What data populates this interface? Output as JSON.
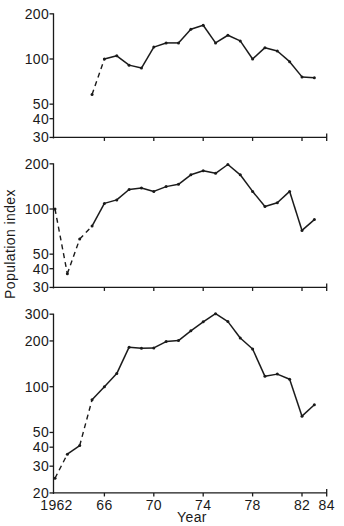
{
  "figure": {
    "ylabel": "Population index",
    "xlabel": "Year",
    "colors": {
      "line": "#1a1a1a",
      "background": "#ffffff"
    }
  },
  "chart_data": {
    "type": "line",
    "title": "",
    "xlabel": "Year",
    "ylabel": "Population index",
    "x_ticks": [
      1962,
      1966,
      1970,
      1974,
      1978,
      1982,
      1984
    ],
    "x_tick_labels": [
      "1962",
      "66",
      "70",
      "74",
      "78",
      "82",
      "84"
    ],
    "xlim": [
      1962,
      1984
    ],
    "yscale": "log",
    "grid": false,
    "legend": "none",
    "panels": [
      {
        "name": "top",
        "ylim": [
          30,
          200
        ],
        "y_ticks": [
          30,
          40,
          50,
          100,
          200
        ],
        "y_tick_labels": [
          "30",
          "40",
          "50",
          "100",
          "200"
        ],
        "x": [
          1965,
          1966,
          1967,
          1968,
          1969,
          1970,
          1971,
          1972,
          1973,
          1974,
          1975,
          1976,
          1977,
          1978,
          1979,
          1980,
          1981,
          1982,
          1983
        ],
        "values": [
          58,
          100,
          105,
          91,
          87,
          120,
          128,
          128,
          158,
          168,
          128,
          144,
          132,
          100,
          119,
          113,
          96,
          76,
          75
        ],
        "dashed_segments_from": [
          1965
        ]
      },
      {
        "name": "middle",
        "ylim": [
          30,
          200
        ],
        "y_ticks": [
          30,
          40,
          50,
          100,
          200
        ],
        "y_tick_labels": [
          "30",
          "40",
          "50",
          "100",
          "200"
        ],
        "x": [
          1962,
          1963,
          1964,
          1965,
          1966,
          1967,
          1968,
          1969,
          1970,
          1971,
          1972,
          1973,
          1974,
          1975,
          1976,
          1977,
          1978,
          1979,
          1980,
          1981,
          1982,
          1983
        ],
        "values": [
          100,
          37,
          63,
          77,
          109,
          115,
          135,
          138,
          131,
          141,
          146,
          169,
          180,
          173,
          198,
          169,
          131,
          104,
          110,
          131,
          72,
          85
        ],
        "dashed_segments_from": [
          1962,
          1963,
          1964
        ]
      },
      {
        "name": "bottom",
        "ylim": [
          20,
          300
        ],
        "y_ticks": [
          20,
          30,
          40,
          50,
          100,
          200,
          300
        ],
        "y_tick_labels": [
          "20",
          "30",
          "40",
          "50",
          "100",
          "200",
          "300"
        ],
        "x": [
          1962,
          1963,
          1964,
          1965,
          1966,
          1967,
          1968,
          1969,
          1970,
          1971,
          1972,
          1973,
          1974,
          1975,
          1976,
          1977,
          1978,
          1979,
          1980,
          1981,
          1982,
          1983
        ],
        "values": [
          25,
          36,
          41,
          82,
          100,
          122,
          182,
          179,
          180,
          198,
          201,
          233,
          267,
          302,
          268,
          209,
          177,
          117,
          121,
          112,
          64,
          76
        ],
        "dashed_segments_from": [
          1962,
          1964
        ],
        "show_x_tick_labels": true
      }
    ]
  }
}
